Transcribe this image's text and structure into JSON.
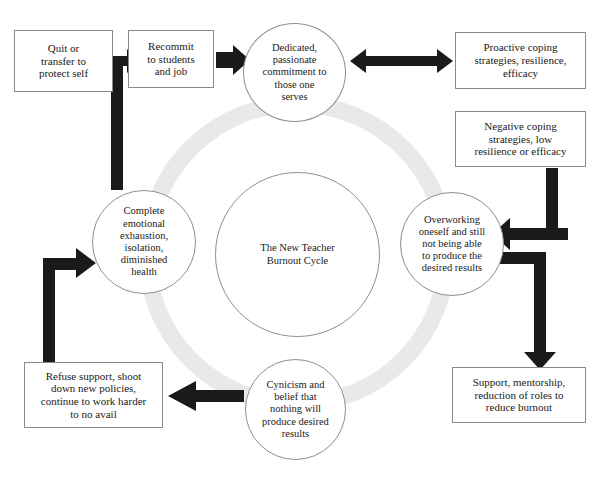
{
  "diagram": {
    "title": "The New Teacher Burnout Cycle",
    "ring_color": "#e9e9e9",
    "arrow_color": "#1a1a1a",
    "circle_stroke": "#8f8f8f",
    "box_stroke": "#8a8a8a",
    "center": {
      "label": "The New Teacher\nBurnout Cycle"
    },
    "cycle_nodes": [
      {
        "id": "dedicated",
        "shape": "circle",
        "position": "top",
        "label": "Dedicated,\npassionate\ncommitment to\nthose one\nserves"
      },
      {
        "id": "overworking",
        "shape": "circle",
        "position": "right",
        "label": "Overworking\noneself and still\nnot being able\nto produce the\ndesired results"
      },
      {
        "id": "cynicism",
        "shape": "circle",
        "position": "bottom",
        "label": "Cynicism and\nbelief that\nnothing will\nproduce desired\nresults"
      },
      {
        "id": "exhaustion",
        "shape": "circle",
        "position": "left",
        "label": "Complete\nemotional\nexhaustion,\nisolation,\ndiminished\nhealth"
      }
    ],
    "boxes": [
      {
        "id": "quit",
        "position": "top-left-outer",
        "label": "Quit or\ntransfer to\nprotect self"
      },
      {
        "id": "recommit",
        "position": "top-left-inner",
        "label": "Recommit\nto students\nand job"
      },
      {
        "id": "proactive",
        "position": "top-right",
        "label": "Proactive coping\nstrategies, resilience,\nefficacy"
      },
      {
        "id": "negative",
        "position": "mid-right-upper",
        "label": "Negative coping\nstrategies, low\nresilience or efficacy"
      },
      {
        "id": "support",
        "position": "bottom-right",
        "label": "Support, mentorship,\nreduction of roles to\nreduce burnout"
      },
      {
        "id": "refuse",
        "position": "bottom-left",
        "label": "Refuse support, shoot\ndown new policies,\ncontinue to work harder\nto no avail"
      }
    ],
    "connectors": [
      {
        "id": "recommit-to-dedicated",
        "type": "arrow-right",
        "from": "recommit",
        "to": "dedicated"
      },
      {
        "id": "quit-recommit-double",
        "type": "double-arrow-horizontal",
        "from": "quit",
        "to": "recommit"
      },
      {
        "id": "exhaustion-up-to-choice",
        "type": "vertical-stem",
        "from": "exhaustion",
        "to": "quit-recommit-double"
      },
      {
        "id": "dedicated-proactive-double",
        "type": "double-arrow-horizontal",
        "from": "dedicated",
        "to": "proactive"
      },
      {
        "id": "negative-to-overworking",
        "type": "elbow-down-left",
        "from": "negative",
        "to": "overworking"
      },
      {
        "id": "overworking-to-support",
        "type": "elbow-right-down",
        "from": "overworking",
        "to": "support"
      },
      {
        "id": "cynicism-to-refuse",
        "type": "arrow-left",
        "from": "cynicism",
        "to": "refuse"
      },
      {
        "id": "refuse-to-exhaustion",
        "type": "elbow-up-right",
        "from": "refuse",
        "to": "exhaustion"
      }
    ]
  }
}
